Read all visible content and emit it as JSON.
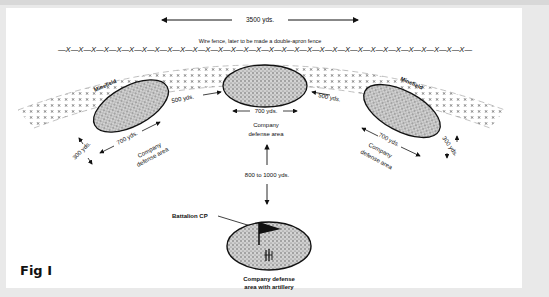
{
  "figure": {
    "caption": "Fig I",
    "top_dimension": "3500 yds.",
    "fence_label": "Wire fence, later to be made a double-apron fence",
    "fence_pattern": "—X—X—X—X—X—X—X—X—X—X—X—X—X—X—X—X—X—X—X—X—X—X—X—X—X—X—X—X—X—X—X—X—",
    "minefield_left": "Minefield",
    "minefield_right": "Minefield",
    "left_company": {
      "label_line1": "Company",
      "label_line2": "defense area",
      "length": "700 yds.",
      "depth": "300 yds."
    },
    "center_company": {
      "label_line1": "Company",
      "label_line2": "defense area",
      "length": "700 yds."
    },
    "right_company": {
      "label_line1": "Company",
      "label_line2": "defense area",
      "length": "700 yds.",
      "depth": "300 yds."
    },
    "gap_left": "500 yds.",
    "gap_right": "500 yds.",
    "rear_distance": "800 to 1000 yds.",
    "battalion_cp": "Battalion CP",
    "rear_company": {
      "label_line1": "Company defense",
      "label_line2": "area with artillery"
    }
  }
}
